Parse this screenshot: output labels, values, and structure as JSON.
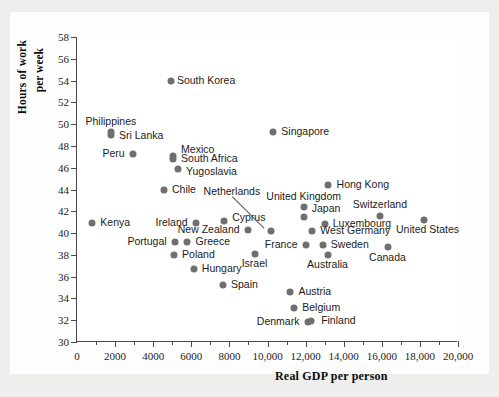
{
  "chart_data": {
    "type": "scatter",
    "title": "",
    "xlabel": "Real GDP per person",
    "ylabel_line1": "Hours of work",
    "ylabel_line2": "per week",
    "xlim": [
      0,
      20000
    ],
    "ylim": [
      30,
      58
    ],
    "xticks": [
      "0",
      "2000",
      "4000",
      "6000",
      "8000",
      "10,000",
      "12,000",
      "14,000",
      "16,000",
      "18,000",
      "20,000"
    ],
    "xtick_values": [
      0,
      2000,
      4000,
      6000,
      8000,
      10000,
      12000,
      14000,
      16000,
      18000,
      20000
    ],
    "xminor_step": 1000,
    "yticks": [
      "30",
      "32",
      "34",
      "36",
      "38",
      "40",
      "42",
      "44",
      "46",
      "48",
      "50",
      "52",
      "54",
      "56",
      "58"
    ],
    "ytick_values": [
      30,
      32,
      34,
      36,
      38,
      40,
      42,
      44,
      46,
      48,
      50,
      52,
      54,
      56,
      58
    ],
    "grid": false,
    "legend": "none",
    "marker_color": "#6f6f6f",
    "axis_color": "#4a4a4a",
    "points": [
      {
        "label": "South Korea",
        "x": 4930,
        "y": 54.0,
        "lx": 4930,
        "ly": 54.0,
        "side": "l"
      },
      {
        "label": "Philippines",
        "x": 1780,
        "y": 49.3,
        "lx": 1780,
        "ly": 50.2,
        "side": "c"
      },
      {
        "label": "Sri Lanka",
        "x": 1780,
        "y": 49.0,
        "lx": 1890,
        "ly": 48.9,
        "side": "l"
      },
      {
        "label": "Peru",
        "x": 2930,
        "y": 47.3,
        "lx": 2820,
        "ly": 47.3,
        "side": "r"
      },
      {
        "label": "Mexico",
        "x": 5040,
        "y": 47.1,
        "lx": 5150,
        "ly": 47.6,
        "side": "l"
      },
      {
        "label": "South Africa",
        "x": 5040,
        "y": 46.8,
        "lx": 5150,
        "ly": 46.8,
        "side": "l"
      },
      {
        "label": "Yugoslavia",
        "x": 5300,
        "y": 45.9,
        "lx": 5410,
        "ly": 45.6,
        "side": "l"
      },
      {
        "label": "Chile",
        "x": 4560,
        "y": 44.0,
        "lx": 4670,
        "ly": 44.0,
        "side": "l"
      },
      {
        "label": "Singapore",
        "x": 10300,
        "y": 49.3,
        "lx": 10410,
        "ly": 49.3,
        "side": "l"
      },
      {
        "label": "Hong Kong",
        "x": 13200,
        "y": 44.4,
        "lx": 13310,
        "ly": 44.4,
        "side": "l"
      },
      {
        "label": "Kenya",
        "x": 800,
        "y": 40.9,
        "lx": 910,
        "ly": 40.9,
        "side": "l"
      },
      {
        "label": "Ireland",
        "x": 6230,
        "y": 40.9,
        "lx": 6120,
        "ly": 40.9,
        "side": "r"
      },
      {
        "label": "Cyprus",
        "x": 7720,
        "y": 41.1,
        "lx": 7830,
        "ly": 41.4,
        "side": "l"
      },
      {
        "label": "Netherlands",
        "x": 10190,
        "y": 40.2,
        "lx": 8130,
        "ly": 43.8,
        "side": "c",
        "leader": true
      },
      {
        "label": "United Kingdom",
        "x": 11900,
        "y": 42.4,
        "lx": 11900,
        "ly": 43.3,
        "side": "c"
      },
      {
        "label": "Japan",
        "x": 11900,
        "y": 41.5,
        "lx": 12010,
        "ly": 42.2,
        "side": "l"
      },
      {
        "label": "Switzerland",
        "x": 15900,
        "y": 41.6,
        "lx": 15900,
        "ly": 42.6,
        "side": "c"
      },
      {
        "label": "Luxembourg",
        "x": 13000,
        "y": 40.8,
        "lx": 13110,
        "ly": 40.8,
        "side": "l"
      },
      {
        "label": "United States",
        "x": 18200,
        "y": 41.2,
        "lx": 18400,
        "ly": 40.3,
        "side": "c"
      },
      {
        "label": "New Zealand",
        "x": 8960,
        "y": 40.3,
        "lx": 8850,
        "ly": 40.3,
        "side": "r"
      },
      {
        "label": "West Germany",
        "x": 12350,
        "y": 40.2,
        "lx": 12460,
        "ly": 40.2,
        "side": "l"
      },
      {
        "label": "Portugal",
        "x": 5130,
        "y": 39.2,
        "lx": 5020,
        "ly": 39.2,
        "side": "r"
      },
      {
        "label": "Greece",
        "x": 5800,
        "y": 39.2,
        "lx": 5910,
        "ly": 39.2,
        "side": "l"
      },
      {
        "label": "France",
        "x": 12000,
        "y": 38.9,
        "lx": 11890,
        "ly": 38.9,
        "side": "r"
      },
      {
        "label": "Sweden",
        "x": 12900,
        "y": 38.9,
        "lx": 13010,
        "ly": 38.9,
        "side": "l"
      },
      {
        "label": "Poland",
        "x": 5090,
        "y": 38.0,
        "lx": 5200,
        "ly": 38.0,
        "side": "l"
      },
      {
        "label": "Israel",
        "x": 9320,
        "y": 38.1,
        "lx": 9320,
        "ly": 37.2,
        "side": "c"
      },
      {
        "label": "Australia",
        "x": 13150,
        "y": 38.0,
        "lx": 13150,
        "ly": 37.1,
        "side": "c"
      },
      {
        "label": "Canada",
        "x": 16300,
        "y": 38.7,
        "lx": 16300,
        "ly": 37.7,
        "side": "c"
      },
      {
        "label": "Hungary",
        "x": 6130,
        "y": 36.7,
        "lx": 6240,
        "ly": 36.7,
        "side": "l"
      },
      {
        "label": "Spain",
        "x": 7660,
        "y": 35.2,
        "lx": 7770,
        "ly": 35.2,
        "side": "l"
      },
      {
        "label": "Austria",
        "x": 11200,
        "y": 34.6,
        "lx": 11310,
        "ly": 34.6,
        "side": "l"
      },
      {
        "label": "Belgium",
        "x": 11400,
        "y": 33.1,
        "lx": 11510,
        "ly": 33.1,
        "side": "l"
      },
      {
        "label": "Denmark",
        "x": 12100,
        "y": 31.8,
        "lx": 11990,
        "ly": 31.8,
        "side": "r"
      },
      {
        "label": "Finland",
        "x": 12300,
        "y": 31.9,
        "lx": 12500,
        "ly": 31.9,
        "side": "l"
      }
    ]
  }
}
